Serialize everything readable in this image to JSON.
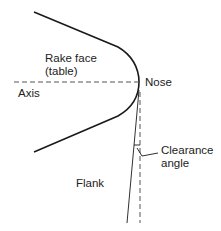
{
  "diagram": {
    "labels": {
      "rake_face_line1": "Rake face",
      "rake_face_line2": "(table)",
      "nose": "Nose",
      "axis": "Axis",
      "clearance_line1": "Clearance",
      "clearance_line2": "angle",
      "flank": "Flank"
    },
    "colors": {
      "outline": "#1a1a1a",
      "dashed": "#555555",
      "text": "#222222",
      "background": "#ffffff"
    }
  }
}
